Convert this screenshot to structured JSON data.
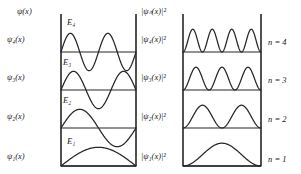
{
  "figure": {
    "stroke_color": "#262626",
    "background": "#ffffff",
    "left_panel": {
      "axis_label": "ψ(x)",
      "axis_label_plain": "psi(x)",
      "level_labels": [
        "ψ₁(x)",
        "ψ₂(x)",
        "ψ₃(x)",
        "ψ₄(x)"
      ],
      "energy_labels": [
        "E₁",
        "E₂",
        "E₃",
        "E₄"
      ],
      "description": "Standing-wave wavefunctions psi_n(x) drawn on each energy level line"
    },
    "right_panel": {
      "axis_label": "|ψₙ(x)|²",
      "level_labels": [
        "|ψ₁(x)|²",
        "|ψ₂(x)|²",
        "|ψ₃(x)|²",
        "|ψ₄(x)|²"
      ],
      "quantum_number_labels": [
        "n = 1",
        "n = 2",
        "n = 3",
        "n = 4"
      ],
      "description": "Probability densities |psi_n(x)|^2 drawn on each level line, all non-negative"
    }
  },
  "chart_data": {
    "type": "line",
    "xlabel": "x",
    "ylabel": "ψ(x)  /  |ψₙ(x)|²",
    "xlim": [
      0,
      1
    ],
    "grid": false,
    "legend": "none",
    "panels": [
      {
        "name": "left",
        "ylabel": "ψ(x)",
        "series": [
          {
            "name": "ψ₁(x)",
            "n": 1,
            "level_label": "E₁",
            "form": "sin(1πx)",
            "nodes": 0,
            "amplitude": 1,
            "signed": true
          },
          {
            "name": "ψ₂(x)",
            "n": 2,
            "level_label": "E₂",
            "form": "sin(2πx)",
            "nodes": 1,
            "amplitude": 1,
            "signed": true
          },
          {
            "name": "ψ₃(x)",
            "n": 3,
            "level_label": "E₃",
            "form": "sin(3πx)",
            "nodes": 2,
            "amplitude": 1,
            "signed": true
          },
          {
            "name": "ψ₄(x)",
            "n": 4,
            "level_label": "E₄",
            "form": "sin(4πx)",
            "nodes": 3,
            "amplitude": 1,
            "signed": true
          }
        ]
      },
      {
        "name": "right",
        "ylabel": "|ψₙ(x)|²",
        "series": [
          {
            "name": "|ψ₁(x)|²",
            "n": 1,
            "level_label": "n = 1",
            "form": "sin²(1πx)",
            "peaks": 1,
            "amplitude": 1,
            "signed": false
          },
          {
            "name": "|ψ₂(x)|²",
            "n": 2,
            "level_label": "n = 2",
            "form": "sin²(2πx)",
            "peaks": 2,
            "amplitude": 1,
            "signed": false
          },
          {
            "name": "|ψ₃(x)|²",
            "n": 3,
            "level_label": "n = 3",
            "form": "sin²(3πx)",
            "peaks": 3,
            "amplitude": 1,
            "signed": false
          },
          {
            "name": "|ψ₄(x)|²",
            "n": 4,
            "level_label": "n = 4",
            "form": "sin²(4πx)",
            "peaks": 4,
            "amplitude": 1,
            "signed": false
          }
        ]
      }
    ]
  }
}
